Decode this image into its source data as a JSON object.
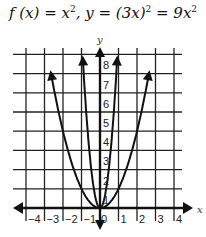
{
  "chart_data": {
    "type": "line",
    "xlabel": "x",
    "ylabel": "y",
    "xlim": [
      -4.5,
      4.5
    ],
    "ylim": [
      0,
      8.3
    ],
    "grid": true,
    "x_ticks": [
      "-4",
      "-3",
      "-2",
      "-1",
      "0",
      "1",
      "2",
      "3",
      "4"
    ],
    "y_ticks": [
      "1",
      "2",
      "3",
      "4",
      "5",
      "6",
      "7",
      "8"
    ],
    "series": [
      {
        "name": "f(x) = x^2",
        "x": [
          -2.7,
          -2,
          -1,
          0,
          1,
          2,
          2.7
        ],
        "values": [
          7.3,
          4,
          1,
          0,
          1,
          4,
          7.3
        ]
      },
      {
        "name": "y = 9x^2",
        "x": [
          -0.96,
          -0.67,
          -0.33,
          0,
          0.33,
          0.67,
          0.96
        ],
        "values": [
          8.3,
          4,
          1,
          0,
          1,
          4,
          8.3
        ]
      }
    ]
  },
  "title": {
    "lhs1": "f (x) = x",
    "exp": "2",
    "mid": ", y = (3x)",
    "exp2": "2",
    "rhs": " = 9x",
    "exp3": "2"
  },
  "axes": {
    "x_label": "x",
    "y_label": "y"
  }
}
